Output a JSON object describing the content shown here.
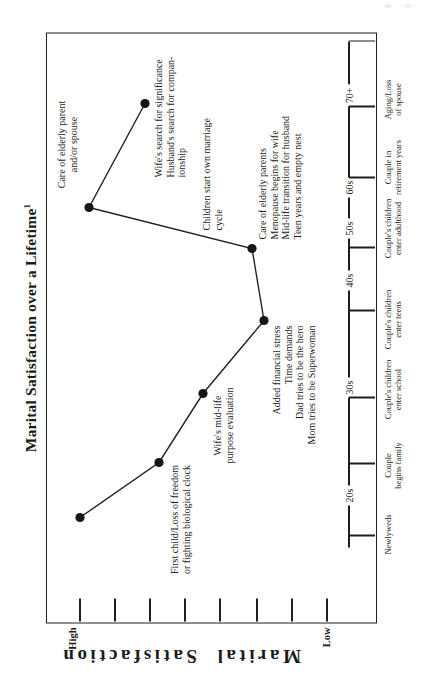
{
  "page": {
    "title": "Marital Satisfaction over a Lifetime",
    "title_superscript": "1"
  },
  "y_axis": {
    "top_label": "High",
    "bottom_label": "Low",
    "axis_label": "Marital Satisfaction"
  },
  "chart_data": {
    "type": "line",
    "title": "Marital Satisfaction over a Lifetime",
    "ylabel": "Marital Satisfaction",
    "y_range_labels": [
      "Low",
      "High"
    ],
    "legend": "none",
    "grid": false,
    "canvas": {
      "width": 677,
      "height": 424
    },
    "plot_box": {
      "x": 54,
      "y": 46,
      "width": 591,
      "height": 331
    },
    "y_axis": {
      "tick_y": [
        80,
        115,
        150,
        185,
        220,
        257,
        292,
        327
      ],
      "tick_len": 23
    },
    "x_axis": {
      "ruler": {
        "y": 349,
        "x1": 130,
        "x2": 636
      },
      "category_tick_x": [
        142,
        214,
        280,
        367,
        430,
        500,
        571
      ],
      "labels_y": 383,
      "categories": [
        {
          "lines": [
            "Newlyweds"
          ],
          "x": 143
        },
        {
          "lines": [
            "Couple",
            "begins family"
          ],
          "x": 212
        },
        {
          "lines": [
            "Couple's children",
            "enter school"
          ],
          "x": 288
        },
        {
          "lines": [
            "Couple's children",
            "enter teens"
          ],
          "x": 358
        },
        {
          "lines": [
            "Couple's children",
            "enter adulthood"
          ],
          "x": 449
        },
        {
          "lines": [
            "Couple in",
            "retirement years"
          ],
          "x": 510
        },
        {
          "lines": [
            "Aging/Loss",
            "of spouse"
          ],
          "x": 578
        }
      ],
      "decades": [
        {
          "label": "20s",
          "x": 182
        },
        {
          "label": "30s",
          "x": 290
        },
        {
          "label": "40s",
          "x": 397
        },
        {
          "label": "50s",
          "x": 449
        },
        {
          "label": "60s",
          "x": 490
        },
        {
          "label": "70+",
          "x": 582
        }
      ]
    },
    "points": [
      {
        "x": 160,
        "y": 80,
        "satisfaction_pct": 100
      },
      {
        "x": 215,
        "y": 159,
        "satisfaction_pct": 68
      },
      {
        "x": 284,
        "y": 203,
        "satisfaction_pct": 50
      },
      {
        "x": 357,
        "y": 264,
        "satisfaction_pct": 25
      },
      {
        "x": 429,
        "y": 252,
        "satisfaction_pct": 30
      },
      {
        "x": 470,
        "y": 89,
        "satisfaction_pct": 96
      },
      {
        "x": 574,
        "y": 145,
        "satisfaction_pct": 74
      }
    ],
    "annotations": [
      {
        "lines": [
          "First child/Loss of freedom",
          "or fighting biological clock"
        ],
        "x": 158,
        "y": 169,
        "align": "center"
      },
      {
        "lines": [
          "Wife's mid-life",
          "purpose evaluation"
        ],
        "x": 252,
        "y": 212,
        "align": "center"
      },
      {
        "lines": [
          "Added financial stress",
          "Time demands",
          "Dad tries to be the hero",
          "Mom tries to be Superwoman"
        ],
        "x": 352,
        "y": 271,
        "align": "right"
      },
      {
        "lines": [
          "Care of elderly parents",
          "Menopause begins for wife",
          "Mid-life transition for husband",
          "Teen years and empty nest"
        ],
        "x": 438,
        "y": 257,
        "align": "left"
      },
      {
        "lines": [
          "Children start own marriage",
          "cycle"
        ],
        "x": 447,
        "y": 201,
        "align": "left"
      },
      {
        "lines": [
          "Care of elderly parent",
          "and/or spouse"
        ],
        "x": 533,
        "y": 56,
        "align": "center"
      },
      {
        "lines": [
          "Wife's search for significance",
          "Husband's search for compan-",
          "ionship"
        ],
        "x": 500,
        "y": 153,
        "align": "left"
      }
    ],
    "point_style": {
      "radius": 4.6,
      "color": "#161616"
    },
    "line_style": {
      "width": 1.4,
      "color": "#222222"
    }
  }
}
